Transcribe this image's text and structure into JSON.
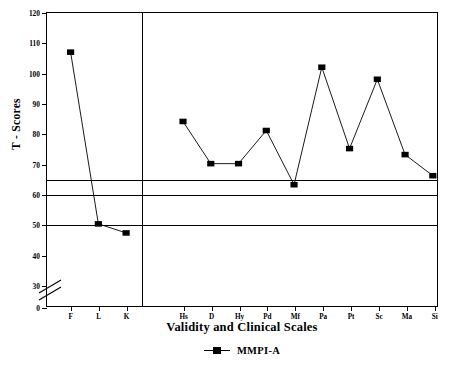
{
  "chart_data": {
    "type": "line",
    "title": "",
    "xlabel": "Validity and Clinical Scales",
    "ylabel": "T - Scores",
    "categories": [
      "F",
      "L",
      "K",
      "Hs",
      "D",
      "Hy",
      "Pd",
      "Mf",
      "Pa",
      "Pt",
      "Sc",
      "Ma",
      "Si"
    ],
    "series": [
      {
        "name": "MMPI-A",
        "values": [
          107,
          50,
          47,
          84,
          70,
          70,
          81,
          63,
          102,
          75,
          98,
          73,
          66
        ],
        "marker": "filled-square",
        "color": "#000000"
      }
    ],
    "ylim": [
      0,
      120
    ],
    "yticks": [
      0,
      30,
      40,
      50,
      60,
      70,
      80,
      90,
      100,
      110,
      120
    ],
    "ytick_labels": [
      "0",
      "30",
      "40",
      "50",
      "60",
      "70",
      "80",
      "90",
      "100",
      "110",
      "120"
    ],
    "axis_break": {
      "between": [
        0,
        30
      ],
      "label": "axis-break"
    },
    "reference_lines": [
      65,
      60,
      50
    ],
    "group_divider_after": "K",
    "grid": false,
    "legend_position": "bottom-center",
    "legend_entries": [
      "MMPI-A"
    ]
  },
  "legend": {
    "label": "MMPI-A"
  },
  "axes": {
    "y_title": "T - Scores",
    "x_title": "Validity and Clinical Scales"
  }
}
